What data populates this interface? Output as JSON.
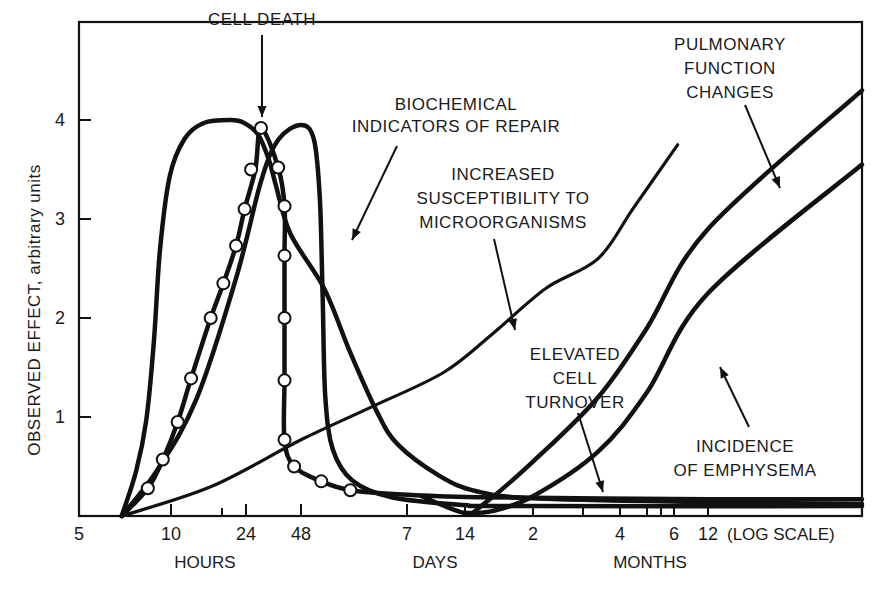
{
  "chart_data": {
    "type": "line",
    "title": "",
    "ylabel": "OBSERVED EFFECT, arbitrary units",
    "xlabel": "",
    "x_scale_note": "(LOG SCALE)",
    "x_unit_groups": [
      "HOURS",
      "DAYS",
      "MONTHS"
    ],
    "ylim": [
      0,
      4.95
    ],
    "yticks": [
      1,
      2,
      3,
      4
    ],
    "xticks": [
      {
        "label": "5",
        "hours": 5
      },
      {
        "label": "10",
        "hours": 10
      },
      {
        "label": "",
        "hours": 18
      },
      {
        "label": "24",
        "hours": 24
      },
      {
        "label": "48",
        "hours": 48
      },
      {
        "label": "7",
        "hours": 168
      },
      {
        "label": "14",
        "hours": 336
      },
      {
        "label": "2",
        "hours": 1440
      },
      {
        "label": "",
        "hours": 2160
      },
      {
        "label": "4",
        "hours": 2880
      },
      {
        "label": "",
        "hours": 3600
      },
      {
        "label": "",
        "hours": 3960
      },
      {
        "label": "6",
        "hours": 4320
      },
      {
        "label": "12",
        "hours": 8640
      }
    ],
    "grid": false,
    "series": [
      {
        "name": "early-response-broad",
        "label": "",
        "markers": false,
        "points": [
          [
            6.9,
            0
          ],
          [
            7.7,
            0.46
          ],
          [
            8.3,
            0.97
          ],
          [
            8.8,
            1.78
          ],
          [
            9.2,
            2.68
          ],
          [
            9.9,
            3.43
          ],
          [
            11.7,
            3.81
          ],
          [
            14.6,
            3.97
          ],
          [
            20,
            4.0
          ],
          [
            23.5,
            3.97
          ],
          [
            28,
            3.85
          ],
          [
            32,
            3.6
          ],
          [
            35,
            3.34
          ],
          [
            42,
            2.85
          ],
          [
            63,
            2.3
          ],
          [
            86,
            1.65
          ],
          [
            118,
            1.05
          ],
          [
            151,
            0.72
          ],
          [
            250,
            0.4
          ],
          [
            430,
            0.25
          ],
          [
            1440,
            0.18
          ],
          [
            8640,
            0.14
          ],
          [
            17280,
            0.12
          ]
        ]
      },
      {
        "name": "cell-death",
        "label": "CELL DEATH",
        "markers": true,
        "points": [
          [
            6.9,
            0
          ],
          [
            8.4,
            0.28
          ],
          [
            9.4,
            0.57
          ],
          [
            10.8,
            0.95
          ],
          [
            12.6,
            1.39
          ],
          [
            15.8,
            2.0
          ],
          [
            18.3,
            2.35
          ],
          [
            21.3,
            2.73
          ],
          [
            23.6,
            3.1
          ],
          [
            27,
            3.5
          ],
          [
            29,
            3.92
          ],
          [
            36,
            3.52
          ],
          [
            39,
            3.13
          ],
          [
            39,
            2.63
          ],
          [
            39,
            2.0
          ],
          [
            39,
            1.37
          ],
          [
            39,
            0.77
          ],
          [
            44,
            0.5
          ],
          [
            61,
            0.35
          ],
          [
            86,
            0.26
          ],
          [
            150,
            0.22
          ],
          [
            430,
            0.19
          ],
          [
            8640,
            0.17
          ],
          [
            17280,
            0.17
          ]
        ]
      },
      {
        "name": "biochemical-indicators-of-repair",
        "label": "BIOCHEMICAL INDICATORS OF REPAIR",
        "markers": false,
        "points": [
          [
            6.9,
            0
          ],
          [
            9.0,
            0.46
          ],
          [
            13.4,
            1.18
          ],
          [
            21.3,
            2.4
          ],
          [
            29,
            3.38
          ],
          [
            36,
            3.8
          ],
          [
            48,
            3.95
          ],
          [
            56,
            3.8
          ],
          [
            60,
            3.2
          ],
          [
            62,
            2.2
          ],
          [
            64,
            1.2
          ],
          [
            70,
            0.67
          ],
          [
            88,
            0.36
          ],
          [
            140,
            0.19
          ],
          [
            330,
            0.11
          ],
          [
            900,
            0.1
          ],
          [
            17280,
            0.1
          ]
        ]
      },
      {
        "name": "increased-susceptibility-to-microorganisms",
        "label": "INCREASED SUSCEPTIBILITY TO MICROORGANISMS",
        "markers": false,
        "points": [
          [
            6.9,
            0
          ],
          [
            16,
            0.3
          ],
          [
            48,
            0.77
          ],
          [
            110,
            1.1
          ],
          [
            260,
            1.45
          ],
          [
            620,
            1.85
          ],
          [
            1600,
            2.3
          ],
          [
            2430,
            2.6
          ],
          [
            3200,
            3.1
          ],
          [
            4650,
            3.75
          ]
        ]
      },
      {
        "name": "elevated-cell-turnover",
        "label": "ELEVATED CELL TURNOVER",
        "markers": false,
        "points": [
          [
            200,
            0.2
          ],
          [
            336,
            0.03
          ],
          [
            500,
            0.12
          ],
          [
            1440,
            0.55
          ],
          [
            2430,
            1.2
          ],
          [
            3600,
            1.9
          ],
          [
            8640,
            2.9
          ],
          [
            17280,
            4.3
          ]
        ]
      },
      {
        "name": "pulmonary-function-changes",
        "label": "PULMONARY FUNCTION CHANGES",
        "markers": false,
        "points": [
          [
            336,
            0.03
          ],
          [
            600,
            0.05
          ],
          [
            1440,
            0.2
          ],
          [
            2430,
            0.65
          ],
          [
            3600,
            1.25
          ],
          [
            8640,
            2.25
          ],
          [
            17280,
            3.55
          ]
        ]
      }
    ],
    "annotations": [
      {
        "text": [
          "CELL DEATH"
        ],
        "target": "cell-death"
      },
      {
        "text": [
          "BIOCHEMICAL",
          "INDICATORS OF REPAIR"
        ],
        "target": "early-response-broad"
      },
      {
        "text": [
          "INCREASED",
          "SUSCEPTIBILITY TO",
          "MICROORGANISMS"
        ],
        "target": "increased-susceptibility-to-microorganisms"
      },
      {
        "text": [
          "PULMONARY",
          "FUNCTION",
          "CHANGES"
        ],
        "target": "elevated-cell-turnover"
      },
      {
        "text": [
          "ELEVATED",
          "CELL",
          "TURNOVER"
        ],
        "target": "cell-death-tail"
      },
      {
        "text": [
          "INCIDENCE",
          "OF EMPHYSEMA"
        ],
        "target": "pulmonary-function-changes"
      }
    ]
  }
}
